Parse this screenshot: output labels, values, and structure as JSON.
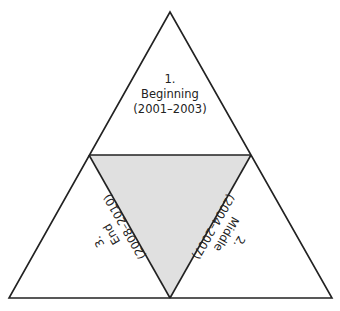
{
  "diagram": {
    "type": "triangle-segmented",
    "segments": [
      {
        "number": "1.",
        "title": "Beginning",
        "range": "(2001–2003)",
        "position": "top"
      },
      {
        "number": "2.",
        "title": "Middle",
        "range": "(2004–2007)",
        "position": "bottom-right"
      },
      {
        "number": "3.",
        "title": "End",
        "range": "(2008–2010)",
        "position": "bottom-left"
      }
    ],
    "colors": {
      "stroke": "#222222",
      "center_fill": "#e0e0e0",
      "background": "#ffffff"
    }
  }
}
